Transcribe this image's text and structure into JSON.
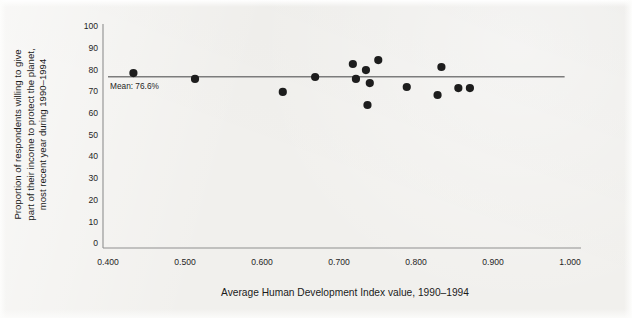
{
  "figure": {
    "background_color": "#f1f0ed",
    "point_color": "#1d1d1d",
    "axis_color": "#8f8f8f",
    "mean_line_color": "#7c7c7c"
  },
  "chart_data": {
    "type": "scatter",
    "title": "",
    "xlabel": "Average Human Development Index value, 1990–1994",
    "ylabel_lines": [
      "Proportion of respondents willing to give",
      "part of their income to protect the planet,",
      "most recent year during 1990–1994"
    ],
    "ylabel": "Proportion of respondents willing to give part of their income to protect the planet, most recent year during 1990–1994",
    "xlim": [
      0.4,
      1.0
    ],
    "ylim": [
      0,
      100
    ],
    "xticks": [
      0.4,
      0.5,
      0.6,
      0.7,
      0.8,
      0.9,
      1.0
    ],
    "xtick_labels": [
      "0.400",
      "0.500",
      "0.600",
      "0.700",
      "0.800",
      "0.900",
      "1.000"
    ],
    "yticks": [
      0,
      10,
      20,
      30,
      40,
      50,
      60,
      70,
      80,
      90,
      100
    ],
    "ytick_labels": [
      "0",
      "10",
      "20",
      "30",
      "40",
      "50",
      "60",
      "70",
      "80",
      "90",
      "100"
    ],
    "grid": false,
    "legend": null,
    "points": [
      {
        "x": 0.433,
        "y": 78.3
      },
      {
        "x": 0.513,
        "y": 75.6
      },
      {
        "x": 0.627,
        "y": 69.6
      },
      {
        "x": 0.669,
        "y": 76.5
      },
      {
        "x": 0.718,
        "y": 82.5
      },
      {
        "x": 0.722,
        "y": 75.6
      },
      {
        "x": 0.735,
        "y": 79.7
      },
      {
        "x": 0.737,
        "y": 63.6
      },
      {
        "x": 0.74,
        "y": 73.7
      },
      {
        "x": 0.751,
        "y": 84.3
      },
      {
        "x": 0.788,
        "y": 71.9
      },
      {
        "x": 0.828,
        "y": 68.2
      },
      {
        "x": 0.833,
        "y": 81.1
      },
      {
        "x": 0.855,
        "y": 71.4
      },
      {
        "x": 0.87,
        "y": 71.4
      }
    ],
    "mean": {
      "value": 76.6,
      "label": "Mean: 76.6%",
      "line_x_start": 0.4,
      "line_x_end": 0.993
    }
  }
}
